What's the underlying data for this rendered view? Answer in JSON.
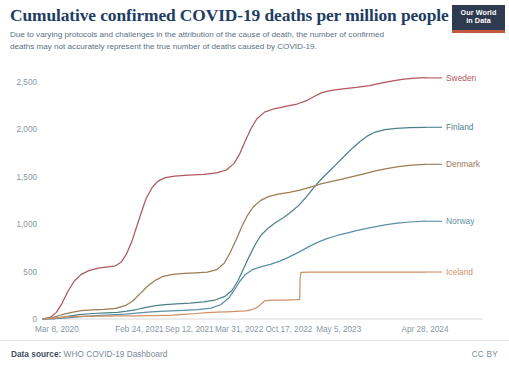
{
  "header": {
    "title": "Cumulative confirmed COVID-19 deaths per million people",
    "subtitle": "Due to varying protocols and challenges in the attribution of the cause of death, the number of confirmed deaths may not accurately represent the true number of deaths caused by COVID-19.",
    "logo_line1": "Our World",
    "logo_line2": "in Data",
    "logo_bg": "#2d3a4f",
    "logo_accent": "#c0593f"
  },
  "footer": {
    "source_prefix": "Data source:",
    "source_value": "WHO COVID-19 Dashboard",
    "license": "CC BY"
  },
  "chart_data": {
    "type": "line",
    "title": "Cumulative confirmed COVID-19 deaths per million people",
    "subtitle": "Due to varying protocols and challenges in the attribution of the cause of death, the number of confirmed deaths may not accurately represent the true number of deaths caused by COVID-19.",
    "xlabel": "",
    "ylabel": "",
    "ylim": [
      0,
      2750
    ],
    "yticks": [
      0,
      500,
      1000,
      1500,
      2000,
      2500
    ],
    "ytick_labels": [
      "0",
      "500",
      "1,000",
      "1,500",
      "2,000",
      "2,500"
    ],
    "xtick_labels": [
      "Mar 8, 2020",
      "Feb 24, 2021",
      "Sep 12, 2021",
      "Mar 31, 2022",
      "Oct 17, 2022",
      "May 5, 2023",
      "Apr 28, 2024"
    ],
    "xtick_positions": [
      0,
      0.2525,
      0.3829,
      0.5133,
      0.6437,
      0.7741,
      1.0
    ],
    "grid": false,
    "legend_position": "right-inline",
    "x_start": "Mar 8, 2020",
    "x_end": "Apr 28, 2024",
    "series": [
      {
        "name": "Sweden",
        "color": "#b1575b",
        "label_color": "#b1575b",
        "final_value": 2540,
        "label_y": 2540,
        "points": [
          [
            0.0,
            2
          ],
          [
            0.02,
            18
          ],
          [
            0.035,
            70
          ],
          [
            0.05,
            165
          ],
          [
            0.065,
            290
          ],
          [
            0.082,
            400
          ],
          [
            0.1,
            470
          ],
          [
            0.12,
            510
          ],
          [
            0.145,
            535
          ],
          [
            0.17,
            548
          ],
          [
            0.19,
            560
          ],
          [
            0.205,
            600
          ],
          [
            0.218,
            680
          ],
          [
            0.232,
            810
          ],
          [
            0.245,
            970
          ],
          [
            0.258,
            1130
          ],
          [
            0.27,
            1270
          ],
          [
            0.285,
            1380
          ],
          [
            0.3,
            1450
          ],
          [
            0.32,
            1490
          ],
          [
            0.345,
            1505
          ],
          [
            0.38,
            1515
          ],
          [
            0.42,
            1525
          ],
          [
            0.455,
            1540
          ],
          [
            0.48,
            1570
          ],
          [
            0.5,
            1640
          ],
          [
            0.515,
            1740
          ],
          [
            0.53,
            1880
          ],
          [
            0.545,
            2010
          ],
          [
            0.56,
            2110
          ],
          [
            0.58,
            2180
          ],
          [
            0.605,
            2215
          ],
          [
            0.635,
            2240
          ],
          [
            0.665,
            2265
          ],
          [
            0.69,
            2300
          ],
          [
            0.71,
            2345
          ],
          [
            0.73,
            2385
          ],
          [
            0.755,
            2410
          ],
          [
            0.785,
            2425
          ],
          [
            0.82,
            2440
          ],
          [
            0.855,
            2460
          ],
          [
            0.885,
            2485
          ],
          [
            0.915,
            2510
          ],
          [
            0.945,
            2528
          ],
          [
            0.975,
            2538
          ],
          [
            1.0,
            2542
          ]
        ]
      },
      {
        "name": "Finland",
        "color": "#4c8189",
        "label_color": "#4c8189",
        "final_value": 2020,
        "label_y": 2020,
        "points": [
          [
            0.0,
            0
          ],
          [
            0.03,
            5
          ],
          [
            0.06,
            25
          ],
          [
            0.095,
            45
          ],
          [
            0.13,
            58
          ],
          [
            0.165,
            64
          ],
          [
            0.195,
            70
          ],
          [
            0.22,
            82
          ],
          [
            0.245,
            100
          ],
          [
            0.27,
            122
          ],
          [
            0.295,
            140
          ],
          [
            0.32,
            152
          ],
          [
            0.35,
            160
          ],
          [
            0.385,
            168
          ],
          [
            0.42,
            180
          ],
          [
            0.45,
            200
          ],
          [
            0.475,
            235
          ],
          [
            0.495,
            300
          ],
          [
            0.51,
            400
          ],
          [
            0.525,
            530
          ],
          [
            0.54,
            660
          ],
          [
            0.555,
            780
          ],
          [
            0.57,
            880
          ],
          [
            0.59,
            960
          ],
          [
            0.61,
            1020
          ],
          [
            0.63,
            1070
          ],
          [
            0.65,
            1130
          ],
          [
            0.67,
            1200
          ],
          [
            0.69,
            1290
          ],
          [
            0.71,
            1390
          ],
          [
            0.73,
            1480
          ],
          [
            0.75,
            1560
          ],
          [
            0.77,
            1640
          ],
          [
            0.79,
            1720
          ],
          [
            0.81,
            1800
          ],
          [
            0.83,
            1870
          ],
          [
            0.85,
            1930
          ],
          [
            0.87,
            1970
          ],
          [
            0.895,
            1995
          ],
          [
            0.925,
            2008
          ],
          [
            0.96,
            2016
          ],
          [
            1.0,
            2020
          ]
        ]
      },
      {
        "name": "Denmark",
        "color": "#9c7b53",
        "label_color": "#9c7b53",
        "final_value": 1630,
        "label_y": 1630,
        "points": [
          [
            0.0,
            2
          ],
          [
            0.025,
            15
          ],
          [
            0.05,
            45
          ],
          [
            0.075,
            70
          ],
          [
            0.1,
            88
          ],
          [
            0.13,
            97
          ],
          [
            0.16,
            102
          ],
          [
            0.19,
            112
          ],
          [
            0.215,
            140
          ],
          [
            0.235,
            190
          ],
          [
            0.255,
            270
          ],
          [
            0.275,
            350
          ],
          [
            0.295,
            410
          ],
          [
            0.315,
            450
          ],
          [
            0.34,
            470
          ],
          [
            0.37,
            480
          ],
          [
            0.4,
            487
          ],
          [
            0.43,
            495
          ],
          [
            0.455,
            520
          ],
          [
            0.475,
            590
          ],
          [
            0.49,
            700
          ],
          [
            0.505,
            830
          ],
          [
            0.52,
            970
          ],
          [
            0.535,
            1090
          ],
          [
            0.55,
            1180
          ],
          [
            0.57,
            1250
          ],
          [
            0.59,
            1290
          ],
          [
            0.615,
            1315
          ],
          [
            0.645,
            1335
          ],
          [
            0.675,
            1360
          ],
          [
            0.7,
            1390
          ],
          [
            0.725,
            1420
          ],
          [
            0.75,
            1445
          ],
          [
            0.78,
            1470
          ],
          [
            0.81,
            1500
          ],
          [
            0.84,
            1530
          ],
          [
            0.87,
            1560
          ],
          [
            0.9,
            1585
          ],
          [
            0.93,
            1605
          ],
          [
            0.965,
            1622
          ],
          [
            1.0,
            1630
          ]
        ]
      },
      {
        "name": "Norway",
        "color": "#5b8fa8",
        "label_color": "#5b8fa8",
        "final_value": 1030,
        "label_y": 1030,
        "points": [
          [
            0.0,
            0
          ],
          [
            0.03,
            3
          ],
          [
            0.065,
            12
          ],
          [
            0.1,
            26
          ],
          [
            0.14,
            36
          ],
          [
            0.18,
            44
          ],
          [
            0.215,
            52
          ],
          [
            0.245,
            62
          ],
          [
            0.275,
            72
          ],
          [
            0.305,
            80
          ],
          [
            0.335,
            86
          ],
          [
            0.37,
            92
          ],
          [
            0.405,
            100
          ],
          [
            0.44,
            115
          ],
          [
            0.465,
            150
          ],
          [
            0.485,
            215
          ],
          [
            0.5,
            300
          ],
          [
            0.515,
            395
          ],
          [
            0.53,
            470
          ],
          [
            0.548,
            520
          ],
          [
            0.57,
            550
          ],
          [
            0.595,
            575
          ],
          [
            0.62,
            610
          ],
          [
            0.645,
            655
          ],
          [
            0.67,
            705
          ],
          [
            0.695,
            760
          ],
          [
            0.72,
            810
          ],
          [
            0.745,
            850
          ],
          [
            0.77,
            880
          ],
          [
            0.795,
            905
          ],
          [
            0.82,
            930
          ],
          [
            0.848,
            955
          ],
          [
            0.875,
            975
          ],
          [
            0.9,
            995
          ],
          [
            0.928,
            1010
          ],
          [
            0.96,
            1022
          ],
          [
            1.0,
            1030
          ]
        ]
      },
      {
        "name": "Iceland",
        "color": "#cf9068",
        "label_color": "#cf9068",
        "final_value": 495,
        "label_y": 495,
        "points": [
          [
            0.0,
            0
          ],
          [
            0.03,
            8
          ],
          [
            0.06,
            22
          ],
          [
            0.1,
            28
          ],
          [
            0.15,
            30
          ],
          [
            0.2,
            32
          ],
          [
            0.25,
            34
          ],
          [
            0.3,
            36
          ],
          [
            0.34,
            40
          ],
          [
            0.37,
            48
          ],
          [
            0.4,
            58
          ],
          [
            0.43,
            66
          ],
          [
            0.455,
            72
          ],
          [
            0.48,
            76
          ],
          [
            0.505,
            80
          ],
          [
            0.53,
            86
          ],
          [
            0.545,
            95
          ],
          [
            0.56,
            120
          ],
          [
            0.572,
            160
          ],
          [
            0.58,
            190
          ],
          [
            0.59,
            196
          ],
          [
            0.61,
            198
          ],
          [
            0.63,
            200
          ],
          [
            0.65,
            202
          ],
          [
            0.665,
            204
          ],
          [
            0.672,
            206
          ],
          [
            0.673,
            420
          ],
          [
            0.675,
            492
          ],
          [
            0.7,
            493
          ],
          [
            0.75,
            493
          ],
          [
            0.8,
            494
          ],
          [
            0.85,
            494
          ],
          [
            0.9,
            494
          ],
          [
            0.95,
            495
          ],
          [
            1.0,
            495
          ]
        ]
      }
    ]
  }
}
